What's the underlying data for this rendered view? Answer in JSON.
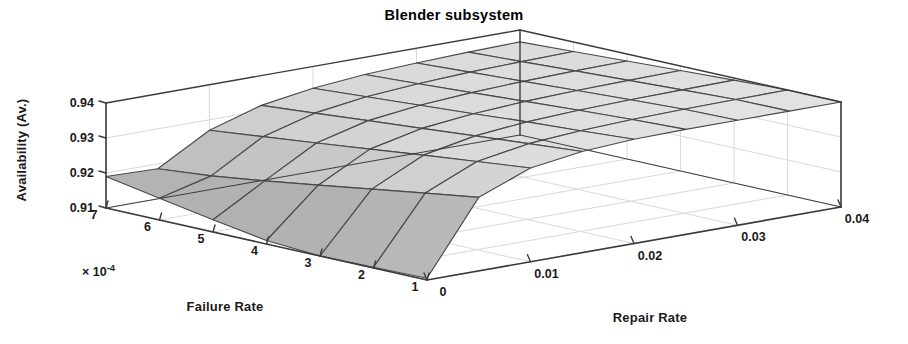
{
  "title": "Blender subsystem",
  "axes": {
    "z": {
      "label": "Availability (Av.)",
      "ticks": [
        "0.94",
        "0.93",
        "0.92",
        "0.91"
      ],
      "values": [
        0.94,
        0.93,
        0.92,
        0.91
      ],
      "range": [
        0.91,
        0.94
      ]
    },
    "x": {
      "label": "Failure Rate",
      "exponent": "× 10",
      "exponent_sup": "-4",
      "ticks": [
        "7",
        "6",
        "5",
        "4",
        "3",
        "2",
        "1"
      ],
      "values": [
        7,
        6,
        5,
        4,
        3,
        2,
        1
      ],
      "range": [
        1,
        7
      ]
    },
    "y": {
      "label": "Repair Rate",
      "ticks": [
        "0",
        "0.01",
        "0.02",
        "0.03",
        "0.04"
      ],
      "values": [
        0,
        0.01,
        0.02,
        0.03,
        0.04
      ],
      "range": [
        0,
        0.04
      ]
    }
  },
  "colors": {
    "axis_line": "#3b3b3b",
    "grid_line": "#d9d9d9",
    "mesh_line": "#4a4a4a",
    "surface_dark": "#9c9c9c",
    "surface_mid": "#c2c2c2",
    "surface_light": "#dedede",
    "background": "#ffffff",
    "text": "#1a1a1a"
  },
  "chart_data": {
    "type": "surface",
    "title": "Blender subsystem",
    "xlabel": "Failure Rate",
    "ylabel": "Repair Rate",
    "zlabel": "Availability (Av.)",
    "xlim": [
      1,
      7
    ],
    "ylim": [
      0,
      0.04
    ],
    "zlim": [
      0.91,
      0.94
    ],
    "x_exponent": -4,
    "grid": true,
    "legend": "none",
    "x": [
      1,
      2,
      3,
      4,
      5,
      6,
      7
    ],
    "y": [
      0,
      0.005,
      0.01,
      0.015,
      0.02,
      0.025,
      0.03,
      0.035,
      0.04
    ],
    "z_note": "Availability Av(failure rate, repair rate); rows indexed by x (failure rate x1e-4), columns by y (repair rate)",
    "z": [
      [
        0.9105,
        0.931,
        0.9368,
        0.9389,
        0.9398,
        0.9402,
        0.9404,
        0.9405,
        0.9406
      ],
      [
        0.9102,
        0.9288,
        0.9352,
        0.9377,
        0.9388,
        0.9394,
        0.9397,
        0.9399,
        0.94
      ],
      [
        0.91,
        0.9265,
        0.9336,
        0.9365,
        0.9379,
        0.9386,
        0.939,
        0.9392,
        0.9394
      ],
      [
        0.911,
        0.9242,
        0.9319,
        0.9352,
        0.9368,
        0.9377,
        0.9382,
        0.9385,
        0.9387
      ],
      [
        0.9135,
        0.922,
        0.9302,
        0.934,
        0.9358,
        0.9368,
        0.9374,
        0.9378,
        0.938
      ],
      [
        0.9162,
        0.92,
        0.9286,
        0.9327,
        0.9348,
        0.9359,
        0.9366,
        0.937,
        0.9373
      ],
      [
        0.919,
        0.9186,
        0.927,
        0.9315,
        0.9338,
        0.9351,
        0.9358,
        0.9363,
        0.9366
      ]
    ]
  }
}
